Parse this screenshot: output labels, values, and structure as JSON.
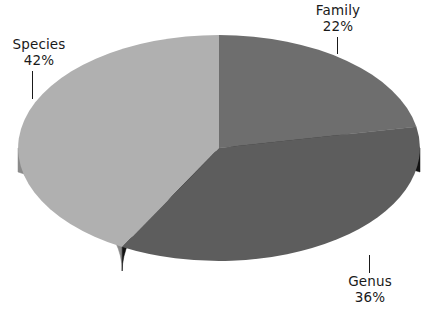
{
  "chart_data": {
    "type": "pie",
    "title": "",
    "subtitle": "",
    "xlabel": "",
    "ylabel": "",
    "legend_position": "none",
    "grid": false,
    "three_d": true,
    "start_angle_deg": 0,
    "direction": "clockwise",
    "categories": [
      "Family",
      "Genus",
      "Species"
    ],
    "values": [
      22,
      36,
      42
    ],
    "value_unit": "%",
    "labels": [
      "Family\n22%",
      "Genus\n36%",
      "Species\n42%"
    ],
    "slices": [
      {
        "name": "Family",
        "value": 22,
        "percent_label": "22%",
        "color": "#6e6e6e",
        "side_color": "#1b1b1b",
        "start_deg": 0,
        "end_deg": 79.2,
        "label_position": "top-right"
      },
      {
        "name": "Genus",
        "value": 36,
        "percent_label": "36%",
        "color": "#5d5d5d",
        "side_color": "#121212",
        "start_deg": 79.2,
        "end_deg": 208.8,
        "label_position": "bottom-right"
      },
      {
        "name": "Species",
        "value": 42,
        "percent_label": "42%",
        "color": "#b0b0b0",
        "side_color": "#8a8a8a",
        "start_deg": 208.8,
        "end_deg": 360,
        "label_position": "left"
      }
    ]
  },
  "colors": {
    "background": "#ffffff",
    "text": "#1a1a1a",
    "leader_line": "#1a1a1a",
    "family_top": "#6e6e6e",
    "genus_top": "#5d5d5d",
    "species_top": "#b0b0b0",
    "family_side": "#1b1b1b",
    "genus_side": "#121212",
    "species_side": "#8a8a8a"
  },
  "labels": {
    "family": {
      "name": "Family",
      "percent": "22%"
    },
    "genus": {
      "name": "Genus",
      "percent": "36%"
    },
    "species": {
      "name": "Species",
      "percent": "42%"
    }
  }
}
